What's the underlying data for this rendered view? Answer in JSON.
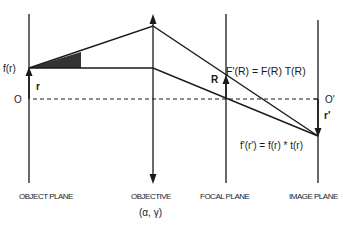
{
  "diagram": {
    "type": "optical ray diagram",
    "colors": {
      "line": "#1a1a1a",
      "shade": "#333333",
      "background": "#ffffff"
    },
    "planes": [
      {
        "id": "object",
        "label": "OBJECT PLANE"
      },
      {
        "id": "objective",
        "label": "OBJECTIVE",
        "sublabel": "(α, γ)"
      },
      {
        "id": "focal",
        "label": "FOCAL PLANE"
      },
      {
        "id": "image",
        "label": "IMAGE PLANE"
      }
    ],
    "labels": {
      "object_function": "f(r)",
      "object_vector": "r",
      "object_origin": "O",
      "focal_vector": "R",
      "focal_equation": "F'(R) = F(R) T(R)",
      "image_origin": "O'",
      "image_vector": "r'",
      "image_equation": "f'(r') = f(r) * t(r)"
    }
  }
}
